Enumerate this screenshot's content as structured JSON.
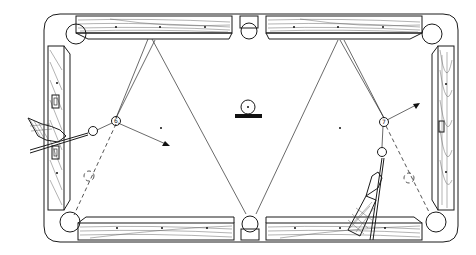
{
  "diagram": {
    "colors": {
      "ink": "#1a1a1a",
      "background": "#ffffff",
      "grain": "#555555"
    },
    "table": {
      "outer": {
        "x": 44,
        "y": 14,
        "w": 414,
        "h": 228
      },
      "pockets": [
        {
          "id": "top-left",
          "cx": 76,
          "cy": 34
        },
        {
          "id": "top-center",
          "cx": 249,
          "cy": 29
        },
        {
          "id": "top-right",
          "cx": 433,
          "cy": 34
        },
        {
          "id": "bottom-left",
          "cx": 70,
          "cy": 222
        },
        {
          "id": "bottom-center",
          "cx": 250,
          "cy": 224
        },
        {
          "id": "bottom-right",
          "cx": 436,
          "cy": 222
        }
      ]
    },
    "balls": [
      {
        "id": "object-ball-left",
        "label": "6",
        "cx": 116,
        "cy": 121
      },
      {
        "id": "cue-ball-left",
        "label": "",
        "cx": 93,
        "cy": 131
      },
      {
        "id": "object-ball-right",
        "label": "7",
        "cx": 384,
        "cy": 122
      },
      {
        "id": "cue-ball-right",
        "label": "",
        "cx": 382,
        "cy": 152
      },
      {
        "id": "legend-ball",
        "label": "",
        "cx": 248,
        "cy": 107
      }
    ],
    "legend": {
      "symbol": "ball-on-bar",
      "meaning": "spot"
    }
  }
}
